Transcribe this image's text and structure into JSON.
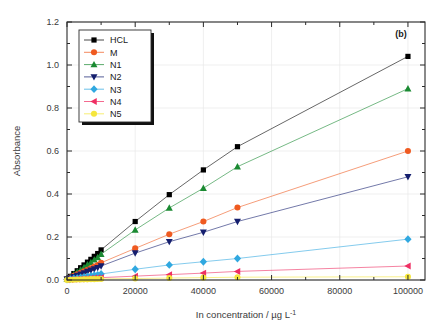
{
  "figure": {
    "panel_label": "(b)",
    "background": "#ffffff"
  },
  "axes": {
    "x": {
      "title": "In concentration / µg L",
      "title_sup": "-1",
      "ticks": [
        "0",
        "20000",
        "40000",
        "60000",
        "80000",
        "100000"
      ],
      "tick_values": [
        0,
        20000,
        40000,
        60000,
        80000,
        100000
      ],
      "min": 0,
      "max": 105000
    },
    "y": {
      "title": "Absorbance",
      "ticks": [
        "0.0",
        "0.2",
        "0.4",
        "0.6",
        "0.8",
        "1.0",
        "1.2"
      ],
      "tick_values": [
        0.0,
        0.2,
        0.4,
        0.6,
        0.8,
        1.0,
        1.2
      ],
      "min": 0.0,
      "max": 1.2
    }
  },
  "legend": {
    "position": "top-left",
    "entries": [
      {
        "label": "HCL",
        "color": "#000000",
        "marker": "square"
      },
      {
        "label": "M",
        "color": "#ef5a20",
        "marker": "circle"
      },
      {
        "label": "N1",
        "color": "#1a8a32",
        "marker": "triangle-up"
      },
      {
        "label": "N2",
        "color": "#141e6e",
        "marker": "triangle-down"
      },
      {
        "label": "N3",
        "color": "#30a8e0",
        "marker": "diamond"
      },
      {
        "label": "N4",
        "color": "#ef2f63",
        "marker": "triangle-left"
      },
      {
        "label": "N5",
        "color": "#f5e63c",
        "marker": "circle"
      }
    ]
  },
  "chart_data": {
    "type": "line",
    "title": "",
    "subtitle": "",
    "xlabel": "In concentration / µg L-1",
    "ylabel": "Absorbance",
    "xlim": [
      0,
      105000
    ],
    "ylim": [
      0.0,
      1.2
    ],
    "grid": true,
    "legend_position": "top-left",
    "annotations": [
      "(b)"
    ],
    "x": [
      0,
      1000,
      2000,
      3000,
      4000,
      5000,
      6000,
      7000,
      8000,
      9000,
      10000,
      20000,
      30000,
      40000,
      50000,
      100000
    ],
    "series": [
      {
        "name": "HCL",
        "color": "#000000",
        "marker": "square",
        "values": [
          0.005,
          0.017,
          0.03,
          0.043,
          0.057,
          0.07,
          0.083,
          0.096,
          0.11,
          0.123,
          0.14,
          0.272,
          0.397,
          0.512,
          0.62,
          1.04
        ]
      },
      {
        "name": "M",
        "color": "#ef5a20",
        "marker": "circle",
        "values": [
          0.004,
          0.011,
          0.019,
          0.026,
          0.033,
          0.04,
          0.048,
          0.055,
          0.063,
          0.07,
          0.08,
          0.147,
          0.213,
          0.272,
          0.337,
          0.6
        ]
      },
      {
        "name": "N1",
        "color": "#1a8a32",
        "marker": "triangle-up",
        "values": [
          0.005,
          0.015,
          0.026,
          0.037,
          0.048,
          0.059,
          0.071,
          0.082,
          0.094,
          0.105,
          0.12,
          0.233,
          0.335,
          0.427,
          0.527,
          0.89
        ]
      },
      {
        "name": "N2",
        "color": "#141e6e",
        "marker": "triangle-down",
        "values": [
          0.003,
          0.009,
          0.015,
          0.021,
          0.027,
          0.033,
          0.039,
          0.045,
          0.051,
          0.057,
          0.065,
          0.125,
          0.178,
          0.222,
          0.272,
          0.48
        ]
      },
      {
        "name": "N3",
        "color": "#30a8e0",
        "marker": "diamond",
        "values": [
          0.002,
          0.004,
          0.007,
          0.009,
          0.012,
          0.014,
          0.017,
          0.019,
          0.022,
          0.024,
          0.028,
          0.05,
          0.07,
          0.085,
          0.1,
          0.19
        ]
      },
      {
        "name": "N4",
        "color": "#ef2f63",
        "marker": "triangle-left",
        "values": [
          0.001,
          0.002,
          0.003,
          0.004,
          0.005,
          0.006,
          0.007,
          0.008,
          0.009,
          0.01,
          0.011,
          0.018,
          0.025,
          0.032,
          0.04,
          0.065
        ]
      },
      {
        "name": "N5",
        "color": "#f5e63c",
        "marker": "circle",
        "values": [
          0.0,
          0.001,
          0.001,
          0.002,
          0.002,
          0.003,
          0.003,
          0.004,
          0.004,
          0.005,
          0.005,
          0.007,
          0.009,
          0.011,
          0.013,
          0.015
        ]
      }
    ]
  }
}
